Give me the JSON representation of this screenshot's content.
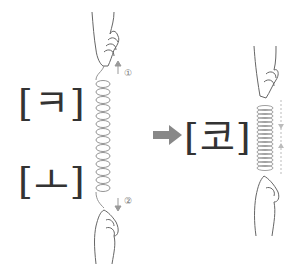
{
  "diagram": {
    "left_top_label": "[ㅋ]",
    "left_bottom_label": "[ㅗ]",
    "result_label": "[코]",
    "step_top": "①",
    "step_bottom": "②",
    "arrow": "right-arrow",
    "colors": {
      "line": "#666666",
      "arrow": "#888888",
      "text": "#333333",
      "dashed": "#aaaaaa"
    }
  }
}
